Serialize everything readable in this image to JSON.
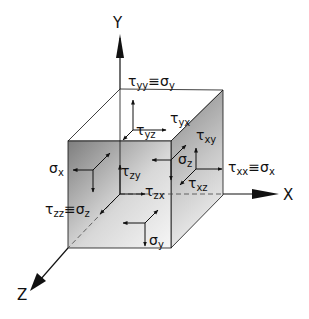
{
  "diagram": {
    "axes": {
      "x": "X",
      "y": "Y",
      "z": "Z"
    },
    "labels": {
      "tyy": {
        "sym": "τ",
        "sub": "yy",
        "eq": "≡σ",
        "eqsub": "y"
      },
      "tyx": {
        "sym": "τ",
        "sub": "yx"
      },
      "tyz": {
        "sym": "τ",
        "sub": "yz"
      },
      "txy": {
        "sym": "τ",
        "sub": "xy"
      },
      "txx": {
        "sym": "τ",
        "sub": "xx",
        "eq": "≡σ",
        "eqsub": "x"
      },
      "txz": {
        "sym": "τ",
        "sub": "xz"
      },
      "sx": {
        "sym": "σ",
        "sub": "x"
      },
      "sz": {
        "sym": "σ",
        "sub": "z"
      },
      "tzy": {
        "sym": "τ",
        "sub": "zy"
      },
      "tzx": {
        "sym": "τ",
        "sub": "zx"
      },
      "tzz": {
        "sym": "τ",
        "sub": "zz",
        "eq": "≡σ",
        "eqsub": "z"
      },
      "sy": {
        "sym": "σ",
        "sub": "y"
      }
    },
    "colors": {
      "front_dark": "#8a8a8a",
      "front_light": "#f2f2f2",
      "side_dark": "#8c8c8c",
      "side_light": "#e6e6e6",
      "line": "#111111"
    }
  }
}
